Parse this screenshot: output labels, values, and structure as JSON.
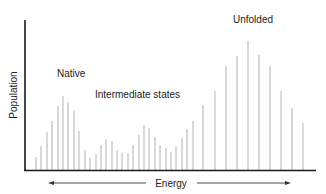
{
  "figure": {
    "y_axis_label": "Population",
    "x_axis_label": "Energy",
    "annotations": {
      "native": "Native",
      "intermediate": "Intermediate states",
      "unfolded": "Unfolded"
    }
  },
  "colors": {
    "axis": "#1a1a1a",
    "bar": "#b8b8b8",
    "text": "#222222",
    "arrow": "#333333"
  },
  "chart_data": {
    "type": "bar",
    "title": "",
    "xlabel": "Energy",
    "ylabel": "Population",
    "grid": false,
    "legend": "none",
    "annotations": [
      {
        "text": "Native",
        "x_region": "low energy",
        "near_peak_index": 5
      },
      {
        "text": "Intermediate states",
        "x_region": "middle energy",
        "near_peak_index": 13
      },
      {
        "text": "Unfolded",
        "x_region": "high energy",
        "near_peak_index": 34
      }
    ],
    "x_units_note": "unlabeled energy axis; bidirectional arrow under axis",
    "bar_x_px": [
      36,
      41,
      47,
      52,
      58,
      63,
      68,
      74,
      79,
      85,
      90,
      96,
      101,
      106,
      112,
      117,
      122,
      128,
      133,
      139,
      144,
      149,
      155,
      160,
      166,
      171,
      176,
      182,
      187,
      193,
      203,
      215,
      226,
      237,
      248,
      259,
      270,
      281,
      292,
      303
    ],
    "values": [
      13,
      24,
      38,
      49,
      64,
      74,
      68,
      59,
      39,
      20,
      12,
      16,
      25,
      31,
      29,
      20,
      17,
      17,
      25,
      35,
      45,
      42,
      33,
      25,
      22,
      18,
      23,
      32,
      41,
      49,
      65,
      79,
      104,
      114,
      129,
      115,
      104,
      79,
      62,
      47
    ],
    "ylim": [
      0,
      150
    ],
    "baseline_px": 170
  }
}
